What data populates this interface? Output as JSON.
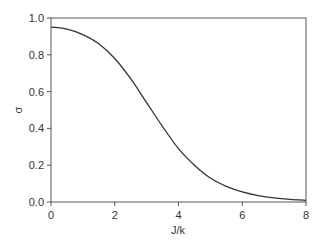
{
  "chart_data": {
    "type": "line",
    "title": "",
    "xlabel": "J/k",
    "ylabel": "σ",
    "xlim": [
      0,
      8
    ],
    "ylim": [
      0,
      1.0
    ],
    "grid": false,
    "legend": null,
    "xticks": [
      0,
      2,
      4,
      6,
      8
    ],
    "xtick_labels": [
      "0",
      "2",
      "4",
      "6",
      "8"
    ],
    "yticks": [
      0.0,
      0.2,
      0.4,
      0.6,
      0.8,
      1.0
    ],
    "ytick_labels": [
      "0.0",
      "0.2",
      "0.4",
      "0.6",
      "0.8",
      "1.0"
    ],
    "series": [
      {
        "name": "σ",
        "color": "#333333",
        "x": [
          0,
          0.5,
          1.0,
          1.5,
          2.0,
          2.5,
          3.0,
          3.5,
          4.0,
          4.5,
          5.0,
          5.5,
          6.0,
          6.5,
          7.0,
          7.5,
          8.0
        ],
        "y": [
          0.95,
          0.94,
          0.91,
          0.86,
          0.78,
          0.67,
          0.54,
          0.41,
          0.29,
          0.2,
          0.13,
          0.085,
          0.055,
          0.035,
          0.022,
          0.014,
          0.009
        ]
      }
    ]
  },
  "labels": {
    "xlabel": "J/k",
    "ylabel": "σ"
  }
}
